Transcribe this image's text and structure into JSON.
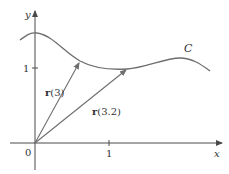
{
  "figure": {
    "colors": {
      "axis": "#4a4a4a",
      "curve": "#6e6e6e",
      "vector": "#6e6e6e",
      "text": "#333333",
      "background": "#ffffff"
    },
    "axes": {
      "x_label": "x",
      "y_label": "y",
      "origin_label": "0",
      "x_tick_label": "1",
      "y_tick_label": "1"
    },
    "curve": {
      "label": "C"
    },
    "vectors": [
      {
        "name": "r3",
        "label_bold": "r",
        "label_arg": "(3)"
      },
      {
        "name": "r32",
        "label_bold": "r",
        "label_arg": "(3.2)"
      }
    ]
  }
}
